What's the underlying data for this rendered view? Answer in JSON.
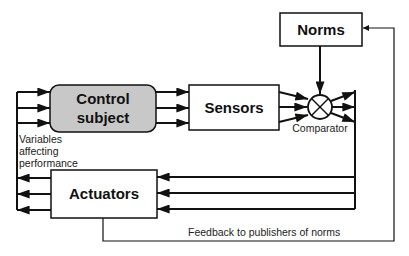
{
  "diagram": {
    "nodes": {
      "norms": {
        "label": "Norms"
      },
      "control_subject": {
        "label_line1": "Control",
        "label_line2": "subject",
        "fill": "#c8c8c8"
      },
      "sensors": {
        "label": "Sensors"
      },
      "actuators": {
        "label": "Actuators"
      },
      "comparator": {
        "label": "Comparator"
      }
    },
    "annotations": {
      "variables_line1": "Variables",
      "variables_line2": "affecting",
      "variables_line3": "performance",
      "feedback": "Feedback  to publishers of norms"
    },
    "edges": [
      {
        "from": "variables",
        "to": "control_subject",
        "count": 3
      },
      {
        "from": "control_subject",
        "to": "sensors",
        "count": 3
      },
      {
        "from": "sensors",
        "to": "comparator",
        "count": 3
      },
      {
        "from": "norms",
        "to": "comparator",
        "count": 1
      },
      {
        "from": "comparator",
        "to": "actuators",
        "count": 3
      },
      {
        "from": "actuators",
        "to": "variables",
        "count": 3
      },
      {
        "from": "actuators",
        "to": "norms",
        "label": "Feedback  to publishers of norms"
      }
    ],
    "colors": {
      "stroke": "#111111",
      "control_fill": "#c8c8c8",
      "background": "#ffffff"
    }
  }
}
